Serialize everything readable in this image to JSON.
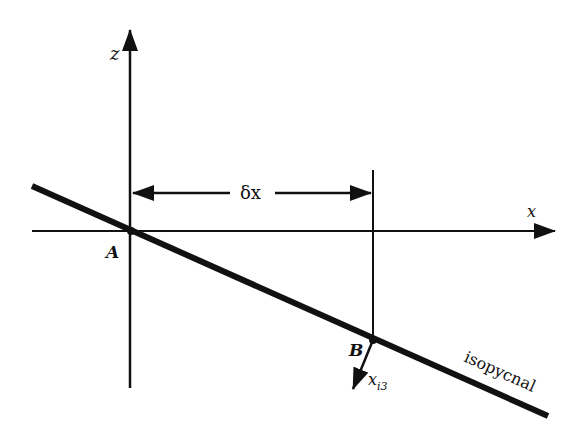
{
  "diagram": {
    "type": "isopycnal-geometry",
    "axes": {
      "vertical_label": "z",
      "horizontal_label": "x"
    },
    "points": [
      {
        "id": "A",
        "label": "A"
      },
      {
        "id": "B",
        "label": "B"
      }
    ],
    "distance_label": "δx",
    "vector_label_main": "x",
    "vector_label_sub": "i3",
    "surface_label": "isopycnal",
    "colors": {
      "ink": "#111111",
      "background": "#ffffff"
    }
  }
}
